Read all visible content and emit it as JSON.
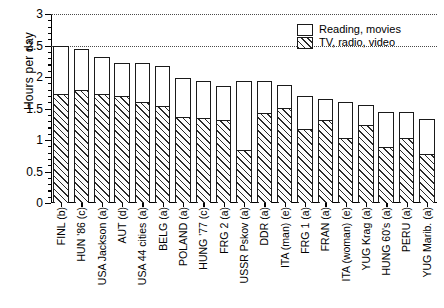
{
  "chart_data": {
    "type": "bar",
    "title": "",
    "xlabel": "",
    "ylabel": "Hours per day",
    "ylim": [
      0,
      3
    ],
    "ytick_labels": [
      "0",
      "0.5",
      "1",
      "1.5",
      "2",
      "2.5",
      "3"
    ],
    "ytick_values": [
      0,
      0.5,
      1,
      1.5,
      2,
      2.5,
      3
    ],
    "minor_tick_step": 0.1,
    "grid": "horizontal dotted gridlines at 2.5 and 3",
    "gridline_values": [
      2.5,
      3
    ],
    "legend_position": "top right",
    "stacked": true,
    "categories": [
      "FINL (b)",
      "HUN '86 (c)",
      "USA Jackson (a)",
      "AUT (d)",
      "USA 44 cities (a)",
      "BELG (a)",
      "POLAND (a)",
      "HUNG '77 (c)",
      "FRG 2 (a)",
      "USSR Pskov (a)",
      "DDR (a)",
      "ITA (man) (e)",
      "FRG 1 (a)",
      "FRAN (a)",
      "ITA (woman) (e)",
      "YUG Krag (a)",
      "HUNG 60's (a)",
      "PERU (a)",
      "YUG Marib. (a)"
    ],
    "series": [
      {
        "name": "TV, radio, video",
        "fill": "hatched",
        "values": [
          1.71,
          1.78,
          1.72,
          1.69,
          1.59,
          1.53,
          1.35,
          1.33,
          1.3,
          0.82,
          1.41,
          1.5,
          1.16,
          1.3,
          1.02,
          1.23,
          0.87,
          1.01,
          0.76
        ]
      },
      {
        "name": "Reading, movies",
        "fill": "white",
        "values": [
          0.79,
          0.67,
          0.6,
          0.53,
          0.63,
          0.64,
          0.64,
          0.61,
          0.56,
          1.12,
          0.53,
          0.38,
          0.54,
          0.35,
          0.58,
          0.32,
          0.57,
          0.43,
          0.57
        ]
      }
    ],
    "totals": [
      2.5,
      2.45,
      2.32,
      2.22,
      2.22,
      2.17,
      1.99,
      1.94,
      1.86,
      1.94,
      1.94,
      1.88,
      1.7,
      1.65,
      1.6,
      1.55,
      1.44,
      1.44,
      1.33
    ]
  },
  "legend": {
    "items": [
      {
        "label": "Reading, movies",
        "swatch": "white-square-icon"
      },
      {
        "label": "TV, radio, video",
        "swatch": "hatched-square-icon"
      }
    ]
  }
}
